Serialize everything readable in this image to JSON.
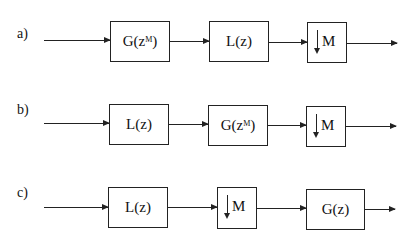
{
  "diagram": {
    "rows": [
      {
        "label": "a)",
        "blocks": [
          {
            "type": "filter",
            "text": "G(z",
            "sup": "M",
            "close": ")"
          },
          {
            "type": "filter",
            "text": "L(z)"
          },
          {
            "type": "downsampler",
            "text": "M",
            "icon": "down-arrow"
          }
        ]
      },
      {
        "label": "b)",
        "blocks": [
          {
            "type": "filter",
            "text": "L(z)"
          },
          {
            "type": "filter",
            "text": "G(z",
            "sup": "M",
            "close": ")"
          },
          {
            "type": "downsampler",
            "text": "M",
            "icon": "down-arrow"
          }
        ]
      },
      {
        "label": "c)",
        "blocks": [
          {
            "type": "filter",
            "text": "L(z)"
          },
          {
            "type": "downsampler",
            "text": "M",
            "icon": "down-arrow"
          },
          {
            "type": "filter",
            "text": "G(z)"
          }
        ]
      }
    ]
  }
}
